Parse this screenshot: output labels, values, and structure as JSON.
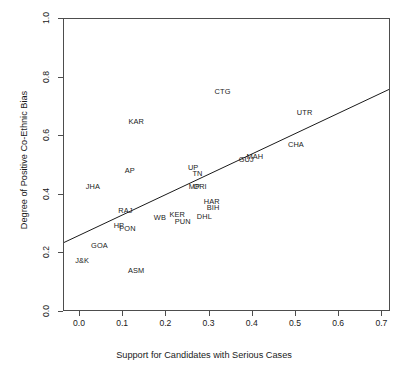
{
  "chart_data": {
    "type": "scatter",
    "title": "",
    "xlabel": "Support for Candidates with Serious Cases",
    "ylabel": "Degree of Positive Co-Ethnic Bias",
    "xlim": [
      -0.037,
      0.72
    ],
    "ylim": [
      0.0,
      1.0
    ],
    "xticks": [
      "0.0",
      "0.1",
      "0.2",
      "0.3",
      "0.4",
      "0.5",
      "0.6",
      "0.7"
    ],
    "xtick_values": [
      0.0,
      0.1,
      0.2,
      0.3,
      0.4,
      0.5,
      0.6,
      0.7
    ],
    "yticks": [
      "0.0",
      "0.2",
      "0.4",
      "0.6",
      "0.8",
      "1.0"
    ],
    "ytick_values": [
      0.0,
      0.2,
      0.4,
      0.6,
      0.8,
      1.0
    ],
    "grid": false,
    "legend": "none",
    "marker_style": "text-labels",
    "points": [
      {
        "label": "J&K",
        "x": 0.005,
        "y": 0.175
      },
      {
        "label": "GOA",
        "x": 0.045,
        "y": 0.225
      },
      {
        "label": "JHA",
        "x": 0.03,
        "y": 0.425
      },
      {
        "label": "HP",
        "x": 0.09,
        "y": 0.295
      },
      {
        "label": "PON",
        "x": 0.11,
        "y": 0.282
      },
      {
        "label": "RAJ",
        "x": 0.105,
        "y": 0.345
      },
      {
        "label": "AP",
        "x": 0.115,
        "y": 0.48
      },
      {
        "label": "ASM",
        "x": 0.13,
        "y": 0.14
      },
      {
        "label": "KAR",
        "x": 0.13,
        "y": 0.65
      },
      {
        "label": "WB",
        "x": 0.185,
        "y": 0.32
      },
      {
        "label": "KER",
        "x": 0.225,
        "y": 0.33
      },
      {
        "label": "PUN",
        "x": 0.238,
        "y": 0.308
      },
      {
        "label": "UP",
        "x": 0.262,
        "y": 0.493
      },
      {
        "label": "TN",
        "x": 0.272,
        "y": 0.47
      },
      {
        "label": "MP",
        "x": 0.265,
        "y": 0.428
      },
      {
        "label": "ORI",
        "x": 0.278,
        "y": 0.425
      },
      {
        "label": "DHL",
        "x": 0.288,
        "y": 0.325
      },
      {
        "label": "HAR",
        "x": 0.305,
        "y": 0.375
      },
      {
        "label": "BIH",
        "x": 0.308,
        "y": 0.355
      },
      {
        "label": "CTG",
        "x": 0.33,
        "y": 0.75
      },
      {
        "label": "GUJ",
        "x": 0.385,
        "y": 0.518
      },
      {
        "label": "MAH",
        "x": 0.405,
        "y": 0.53
      },
      {
        "label": "CHA",
        "x": 0.5,
        "y": 0.57
      },
      {
        "label": "UTR",
        "x": 0.52,
        "y": 0.68
      }
    ],
    "regression_line": {
      "visible": true,
      "x_start": -0.037,
      "y_start": 0.232,
      "x_end": 0.72,
      "y_end": 0.758,
      "slope": 0.695,
      "intercept": 0.258,
      "color": "#1a1a1a"
    },
    "colors": {
      "frame": "#4d4d4d",
      "text": "#1a1a1a",
      "line": "#1a1a1a",
      "background": "#ffffff"
    }
  }
}
